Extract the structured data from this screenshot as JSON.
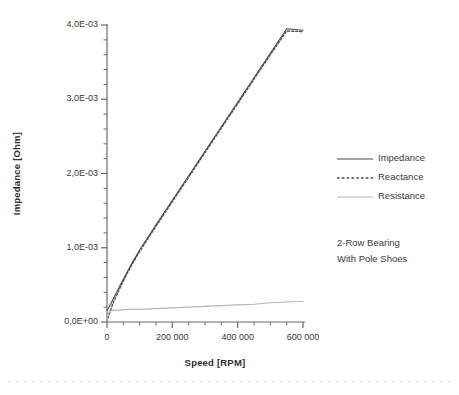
{
  "chart_data": {
    "type": "line",
    "title": "",
    "xlabel": "Speed [RPM]",
    "ylabel": "Impedance [Ohm]",
    "xlim": [
      0,
      600000
    ],
    "ylim": [
      0,
      0.004
    ],
    "grid": false,
    "legend_position": "right",
    "x_ticks": [
      "0",
      "200 000",
      "400 000",
      "600 000"
    ],
    "x_tick_values": [
      0,
      200000,
      400000,
      600000
    ],
    "x_minor_tick_interval": 50000,
    "y_ticks": [
      "0,0E+00",
      "1,0E-03",
      "2,0E-03",
      "3,0E-03",
      "4,0E-03"
    ],
    "y_tick_values": [
      0,
      0.001,
      0.002,
      0.003,
      0.004
    ],
    "y_minor_tick_interval": 0.0002,
    "annotation": {
      "line1": "2-Row Bearing",
      "line2": "With Pole Shoes"
    },
    "series": [
      {
        "name": "Impedance",
        "style": "solid",
        "color": "#4a4a4a",
        "x": [
          0,
          5000,
          10000,
          20000,
          40000,
          60000,
          80000,
          100000,
          150000,
          200000,
          250000,
          300000,
          350000,
          400000,
          450000,
          500000,
          550000,
          600000
        ],
        "values": [
          0.00016,
          0.00019,
          0.00023,
          0.00032,
          0.00049,
          0.00066,
          0.00082,
          0.00097,
          0.00131,
          0.00164,
          0.00197,
          0.0023,
          0.00263,
          0.00296,
          0.00329,
          0.00362,
          0.00395,
          0.00393
        ]
      },
      {
        "name": "Reactance",
        "style": "dotted",
        "color": "#4a4a4a",
        "x": [
          0,
          5000,
          10000,
          20000,
          40000,
          60000,
          80000,
          100000,
          150000,
          200000,
          250000,
          300000,
          350000,
          400000,
          450000,
          500000,
          550000,
          600000
        ],
        "values": [
          0.0,
          8e-05,
          0.00015,
          0.00027,
          0.00046,
          0.00064,
          0.0008,
          0.00095,
          0.00129,
          0.00162,
          0.00195,
          0.00228,
          0.00261,
          0.00294,
          0.00327,
          0.0036,
          0.00392,
          0.00391
        ]
      },
      {
        "name": "Resistance",
        "style": "solid",
        "color": "#b4b4b4",
        "x": [
          0,
          5000,
          10000,
          20000,
          40000,
          60000,
          80000,
          100000,
          150000,
          200000,
          250000,
          300000,
          350000,
          400000,
          450000,
          500000,
          550000,
          600000
        ],
        "values": [
          0.0,
          0.00012,
          0.00015,
          0.00016,
          0.00016,
          0.00017,
          0.00017,
          0.00017,
          0.00018,
          0.00019,
          0.0002,
          0.00021,
          0.00022,
          0.00023,
          0.00024,
          0.00026,
          0.00027,
          0.00028
        ]
      }
    ]
  },
  "legend": {
    "items": [
      {
        "label": "Impedance"
      },
      {
        "label": "Reactance"
      },
      {
        "label": "Resistance"
      }
    ]
  },
  "colors": {
    "axis": "#6b6b6b",
    "dark_series": "#4a4a4a",
    "light_series": "#b4b4b4",
    "text": "#3a3a3a"
  }
}
